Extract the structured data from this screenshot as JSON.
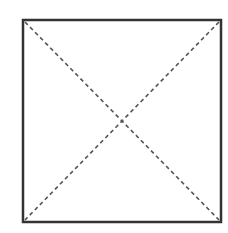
{
  "diagram": {
    "type": "square-with-diagonals",
    "background": "#ffffff",
    "square": {
      "x": 23,
      "y": 20,
      "width": 198,
      "height": 202,
      "stroke": "#333333",
      "stroke_width": 2.5
    },
    "diagonals": [
      {
        "name": "diagonal-tl-br",
        "x1": 25,
        "y1": 22,
        "x2": 219,
        "y2": 220
      },
      {
        "name": "diagonal-tr-bl",
        "x1": 219,
        "y1": 22,
        "x2": 25,
        "y2": 220
      }
    ],
    "diagonal_style": {
      "stroke": "#555555",
      "stroke_width": 1.6,
      "dasharray": "4 3.2"
    }
  }
}
